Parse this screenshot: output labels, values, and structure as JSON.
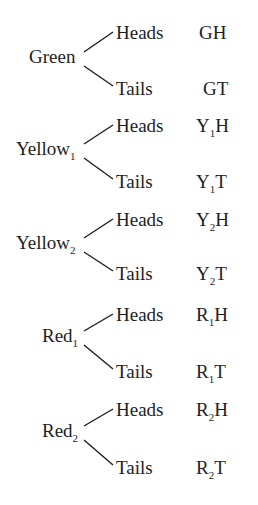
{
  "diagram": {
    "type": "tree",
    "title": "",
    "groups": [
      {
        "root": "Green",
        "root_sub": "",
        "root_x": 29,
        "root_y": 63,
        "branches": [
          {
            "label": "Heads",
            "outcome": "G",
            "outcome_sub": "",
            "outcome_tail": "H",
            "y": 39
          },
          {
            "label": "Tails",
            "outcome": "G",
            "outcome_sub": "",
            "outcome_tail": "T",
            "y": 95
          }
        ]
      },
      {
        "root": "Yellow",
        "root_sub": "1",
        "root_x": 16,
        "root_y": 155,
        "branches": [
          {
            "label": "Heads",
            "outcome": "Y",
            "outcome_sub": "1",
            "outcome_tail": "H",
            "y": 132
          },
          {
            "label": "Tails",
            "outcome": "Y",
            "outcome_sub": "1",
            "outcome_tail": "T",
            "y": 188
          }
        ]
      },
      {
        "root": "Yellow",
        "root_sub": "2",
        "root_x": 16,
        "root_y": 249,
        "branches": [
          {
            "label": "Heads",
            "outcome": "Y",
            "outcome_sub": "2",
            "outcome_tail": "H",
            "y": 226
          },
          {
            "label": "Tails",
            "outcome": "Y",
            "outcome_sub": "2",
            "outcome_tail": "T",
            "y": 280
          }
        ]
      },
      {
        "root": "Red",
        "root_sub": "1",
        "root_x": 42,
        "root_y": 342,
        "branches": [
          {
            "label": "Heads",
            "outcome": "R",
            "outcome_sub": "1",
            "outcome_tail": "H",
            "y": 321
          },
          {
            "label": "Tails",
            "outcome": "R",
            "outcome_sub": "1",
            "outcome_tail": "T",
            "y": 378
          }
        ]
      },
      {
        "root": "Red",
        "root_sub": "2",
        "root_x": 42,
        "root_y": 437,
        "branches": [
          {
            "label": "Heads",
            "outcome": "R",
            "outcome_sub": "2",
            "outcome_tail": "H",
            "y": 416
          },
          {
            "label": "Tails",
            "outcome": "R",
            "outcome_sub": "2",
            "outcome_tail": "T",
            "y": 474
          }
        ]
      }
    ],
    "outcomes_list": [
      "GH",
      "GT",
      "Y1H",
      "Y1T",
      "Y2H",
      "Y2T",
      "R1H",
      "R1T",
      "R2H",
      "R2T"
    ],
    "colors": {
      "ink": "#1e1e1e",
      "background": "#ffffff"
    }
  }
}
